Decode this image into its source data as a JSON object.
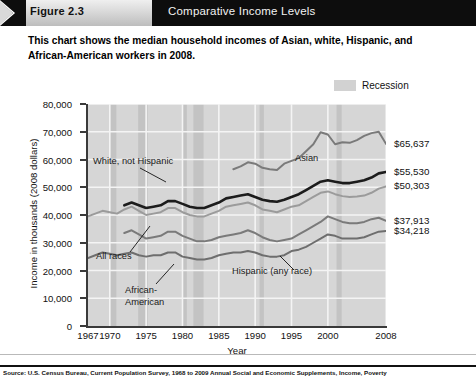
{
  "header": {
    "figure_tab_label": "Figure 2.3",
    "title": "Comparative Income Levels",
    "arrow_icon": "chevron-right-icon"
  },
  "subtitle": "This chart shows the median household incomes of Asian, white, Hispanic, and African-American workers in 2008.",
  "legend": {
    "label": "Recession",
    "swatch_color": "#d2d2d2"
  },
  "source": "Source: U.S. Census Bureau, Current Population Survey, 1968 to 2009 Annual Social and Economic Supplements, Income, Poverty",
  "chart_data": {
    "type": "line",
    "title": "Comparative Income Levels",
    "xlabel": "Year",
    "ylabel": "Income in thousands (2008 dollars)",
    "xlim": [
      1967,
      2008
    ],
    "ylim": [
      0,
      80000
    ],
    "grid": true,
    "legend_position": "top-right",
    "ytick_labels": [
      "0",
      "10,000",
      "20,000",
      "30,000",
      "40,000",
      "50,000",
      "60,000",
      "70,000",
      "80,000"
    ],
    "ytick_values": [
      0,
      10000,
      20000,
      30000,
      40000,
      50000,
      60000,
      70000,
      80000
    ],
    "xtick_labels": [
      "1967",
      "1970",
      "1975",
      "1980",
      "1985",
      "1990",
      "1995",
      "2000",
      "2008"
    ],
    "xtick_values": [
      1967,
      1970,
      1975,
      1980,
      1985,
      1990,
      1995,
      2000,
      2008
    ],
    "x": [
      1967,
      1968,
      1969,
      1970,
      1971,
      1972,
      1973,
      1974,
      1975,
      1976,
      1977,
      1978,
      1979,
      1980,
      1981,
      1982,
      1983,
      1984,
      1985,
      1986,
      1987,
      1988,
      1989,
      1990,
      1991,
      1992,
      1993,
      1994,
      1995,
      1996,
      1997,
      1998,
      1999,
      2000,
      2001,
      2002,
      2003,
      2004,
      2005,
      2006,
      2007,
      2008
    ],
    "series": [
      {
        "name": "Asian",
        "color": "#7a7a7a",
        "label_in_plot": "Asian",
        "end_value_label": "$65,637",
        "end_value": 65637,
        "values": [
          null,
          null,
          null,
          null,
          null,
          null,
          null,
          null,
          null,
          null,
          null,
          null,
          null,
          null,
          null,
          null,
          null,
          null,
          null,
          null,
          56500,
          57500,
          59000,
          58500,
          57000,
          56500,
          56200,
          58500,
          59500,
          60500,
          63000,
          65500,
          69800,
          69000,
          65500,
          66200,
          66000,
          67000,
          68500,
          69500,
          70000,
          65637
        ]
      },
      {
        "name": "White, not Hispanic",
        "color": "#1c1c1c",
        "label_in_plot": "White, not Hispanic",
        "end_value_label": "$55,530",
        "end_value": 55530,
        "values": [
          null,
          null,
          null,
          null,
          null,
          43500,
          44500,
          43500,
          42500,
          43000,
          43500,
          45000,
          45000,
          44000,
          43000,
          42500,
          42500,
          43500,
          44500,
          46000,
          46500,
          47000,
          47500,
          46500,
          45500,
          45000,
          44800,
          45500,
          46500,
          47500,
          49000,
          50500,
          52000,
          52500,
          52000,
          51500,
          51500,
          52000,
          52500,
          53500,
          55000,
          55530
        ]
      },
      {
        "name": "All races",
        "color": "#9b9b9b",
        "label_in_plot": "All races",
        "end_value_label": "$50,303",
        "end_value": 50303,
        "values": [
          39500,
          40500,
          41500,
          41000,
          40500,
          42000,
          43000,
          41500,
          40000,
          40500,
          41000,
          42500,
          42500,
          41000,
          40000,
          39500,
          39500,
          40500,
          41500,
          43000,
          43500,
          44000,
          44500,
          43500,
          42000,
          41500,
          41000,
          42000,
          43000,
          43500,
          45000,
          46500,
          48000,
          48500,
          47500,
          46800,
          46500,
          46700,
          47000,
          48000,
          49500,
          50303
        ]
      },
      {
        "name": "Hispanic (any race)",
        "color": "#7a7a7a",
        "label_in_plot": "Hispanic (any race)",
        "end_value_label": "$37,913",
        "end_value": 37913,
        "values": [
          null,
          null,
          null,
          null,
          null,
          33500,
          34500,
          33000,
          31500,
          32000,
          32500,
          34000,
          34000,
          32500,
          31500,
          30500,
          30500,
          31000,
          32000,
          32500,
          33000,
          33500,
          34500,
          33500,
          32000,
          31000,
          30500,
          31000,
          31500,
          33000,
          34500,
          36000,
          37500,
          39500,
          38500,
          37500,
          37000,
          37000,
          37500,
          38500,
          39000,
          37913
        ]
      },
      {
        "name": "African-American",
        "color": "#6e6e6e",
        "label_in_plot": "African-American",
        "end_value_label": "$34,218",
        "end_value": 34218,
        "values": [
          24500,
          25500,
          26500,
          26000,
          25500,
          26000,
          26500,
          25500,
          25000,
          25500,
          25500,
          26500,
          26500,
          25000,
          24500,
          24000,
          24000,
          24500,
          25500,
          26000,
          26500,
          26500,
          27000,
          26500,
          25500,
          25000,
          25000,
          25500,
          27000,
          27500,
          28500,
          30000,
          31500,
          33000,
          32500,
          31500,
          31500,
          31500,
          32000,
          33000,
          34000,
          34218
        ]
      }
    ],
    "recession_bands": [
      {
        "start": 1969.9,
        "end": 1970.9
      },
      {
        "start": 1973.9,
        "end": 1975.2
      },
      {
        "start": 1980.0,
        "end": 1980.6
      },
      {
        "start": 1981.5,
        "end": 1982.9
      },
      {
        "start": 1990.6,
        "end": 1991.2
      },
      {
        "start": 2001.2,
        "end": 2001.9
      },
      {
        "start": 2007.9,
        "end": 2008.0
      }
    ]
  }
}
